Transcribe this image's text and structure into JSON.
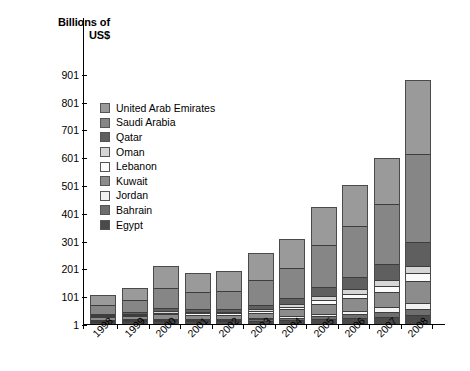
{
  "axis_title": "Billions of\nUS$",
  "axis_title_line1": "Billions of",
  "axis_title_line2": "US$",
  "legend": {
    "items": [
      {
        "label": "United Arab Emirates",
        "color": "#9a9a9a"
      },
      {
        "label": "Saudi Arabia",
        "color": "#868686"
      },
      {
        "label": "Qatar",
        "color": "#5f5f5f"
      },
      {
        "label": "Oman",
        "color": "#d6d6d6"
      },
      {
        "label": "Lebanon",
        "color": "#fbfbfb"
      },
      {
        "label": "Kuwait",
        "color": "#8c8c8c"
      },
      {
        "label": "Jordan",
        "color": "#f2f2f2"
      },
      {
        "label": "Bahrain",
        "color": "#6e6e6e"
      },
      {
        "label": "Egypt",
        "color": "#4a4a4a"
      }
    ]
  },
  "chart_data": {
    "type": "bar",
    "subtype": "stacked",
    "title": "",
    "xlabel": "",
    "ylabel": "Billions of US$",
    "ylim": [
      1,
      951
    ],
    "yticks": [
      1,
      101,
      201,
      301,
      401,
      501,
      601,
      701,
      801,
      901
    ],
    "ytick_labels": [
      "1",
      "101",
      "201",
      "301",
      "401",
      "501",
      "601",
      "701",
      "801",
      "901"
    ],
    "grid": false,
    "legend_position": "inside-upper-left",
    "categories": [
      "1998",
      "1999",
      "2000",
      "2001",
      "2002",
      "2003",
      "2004",
      "2005",
      "2006",
      "2007",
      "2008"
    ],
    "series": [
      {
        "name": "Egypt",
        "color": "#4a4a4a",
        "values": [
          5,
          6,
          7,
          7,
          7,
          8,
          10,
          14,
          18,
          23,
          30
        ]
      },
      {
        "name": "Bahrain",
        "color": "#6e6e6e",
        "values": [
          3,
          4,
          5,
          5,
          5,
          6,
          8,
          11,
          14,
          18,
          22
        ]
      },
      {
        "name": "Jordan",
        "color": "#f2f2f2",
        "values": [
          2,
          3,
          3,
          3,
          4,
          4,
          6,
          9,
          12,
          15,
          19
        ]
      },
      {
        "name": "Kuwait",
        "color": "#8c8c8c",
        "values": [
          9,
          11,
          17,
          14,
          14,
          19,
          25,
          36,
          45,
          55,
          80
        ]
      },
      {
        "name": "Lebanon",
        "color": "#fbfbfb",
        "values": [
          4,
          5,
          5,
          5,
          6,
          7,
          9,
          13,
          17,
          22,
          28
        ]
      },
      {
        "name": "Oman",
        "color": "#d6d6d6",
        "values": [
          3,
          4,
          6,
          5,
          5,
          7,
          9,
          13,
          17,
          21,
          27
        ]
      },
      {
        "name": "Qatar",
        "color": "#5f5f5f",
        "values": [
          5,
          7,
          11,
          10,
          11,
          15,
          22,
          33,
          44,
          58,
          85
        ]
      },
      {
        "name": "Saudi Arabia",
        "color": "#868686",
        "values": [
          32,
          41,
          70,
          62,
          65,
          88,
          108,
          151,
          182,
          215,
          316
        ]
      },
      {
        "name": "United Arab Emirates",
        "color": "#9a9a9a",
        "values": [
          34,
          45,
          81,
          69,
          70,
          97,
          107,
          139,
          148,
          166,
          268
        ]
      }
    ],
    "totals": [
      97,
      126,
      205,
      180,
      187,
      251,
      304,
      419,
      497,
      593,
      875
    ]
  }
}
